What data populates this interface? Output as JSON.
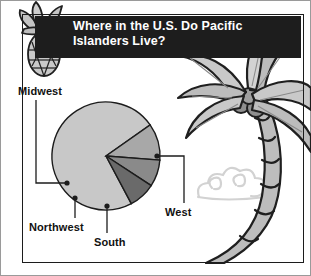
{
  "header": {
    "title": "Where in the U.S. Do Pacific Islanders Live?",
    "title_line1": "Where in the U.S. Do Pacific",
    "title_line2": "Islanders Live?",
    "background_color": "#1d1d1d",
    "text_color": "#ffffff"
  },
  "decorations": {
    "pineapple": "pineapple-illustration",
    "palm_tree": "palm-tree-illustration",
    "cloud": "cloud-illustration"
  },
  "labels": {
    "midwest": "Midwest",
    "west": "West",
    "northwest": "Northwest",
    "south": "South"
  },
  "colors": {
    "west": "#c8c8c8",
    "south": "#a8a8a8",
    "northwest": "#8a8a8a",
    "midwest": "#6a6a6a",
    "outline": "#1c1c1c",
    "frame": "#1c1c1c",
    "leader": "#1c1c1c",
    "art_light": "#cfcfcf",
    "art_mid": "#a9a9a9",
    "art_dark": "#6f6f6f"
  },
  "chart_data": {
    "type": "pie",
    "title": "Where in the U.S. Do Pacific Islanders Live?",
    "categories": [
      "West",
      "South",
      "Northwest",
      "Midwest"
    ],
    "values": [
      73,
      11,
      8,
      8
    ],
    "unit": "percent",
    "start_angle_deg": 62,
    "direction": "clockwise",
    "legend": "none",
    "labels_position": "external-with-leader-lines",
    "slices": [
      {
        "name": "West",
        "value": 73,
        "color": "#c8c8c8",
        "label": "West"
      },
      {
        "name": "South",
        "value": 11,
        "color": "#a8a8a8",
        "label": "South"
      },
      {
        "name": "Northwest",
        "value": 8,
        "color": "#8a8a8a",
        "label": "Northwest"
      },
      {
        "name": "Midwest",
        "value": 8,
        "color": "#6a6a6a",
        "label": "Midwest"
      }
    ]
  }
}
